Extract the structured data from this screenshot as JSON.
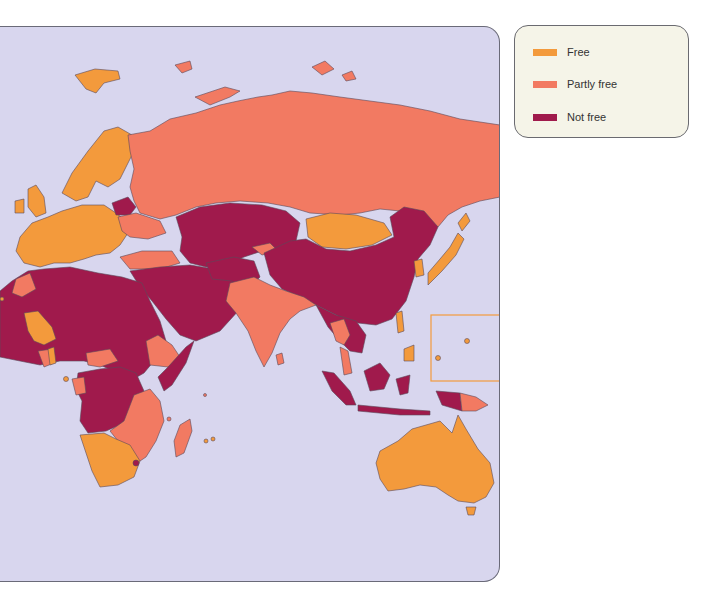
{
  "legend": {
    "items": [
      {
        "label": "Free",
        "color": "#f39a3c"
      },
      {
        "label": "Partly free",
        "color": "#f27a62"
      },
      {
        "label": "Not free",
        "color": "#a01a4c"
      }
    ]
  },
  "map": {
    "ocean_color": "#d8d6ee",
    "border_color": "#5a4a5a",
    "inset_box_color": "#f39a3c",
    "regions": [
      {
        "name": "Western Europe",
        "status": "Free"
      },
      {
        "name": "Scandinavia",
        "status": "Free"
      },
      {
        "name": "Belarus",
        "status": "Not free"
      },
      {
        "name": "Russia",
        "status": "Partly free"
      },
      {
        "name": "Central Asia",
        "status": "Not free"
      },
      {
        "name": "Mongolia",
        "status": "Free"
      },
      {
        "name": "China",
        "status": "Not free"
      },
      {
        "name": "India",
        "status": "Partly free"
      },
      {
        "name": "Middle East",
        "status": "Not free"
      },
      {
        "name": "North Africa",
        "status": "Not free"
      },
      {
        "name": "Mali",
        "status": "Free"
      },
      {
        "name": "Ethiopia",
        "status": "Partly free"
      },
      {
        "name": "Central Africa",
        "status": "Not free"
      },
      {
        "name": "East Africa",
        "status": "Partly free"
      },
      {
        "name": "Southern Africa",
        "status": "Free"
      },
      {
        "name": "Madagascar",
        "status": "Partly free"
      },
      {
        "name": "Japan",
        "status": "Free"
      },
      {
        "name": "South Korea",
        "status": "Free"
      },
      {
        "name": "Southeast Asia",
        "status": "Not free"
      },
      {
        "name": "Thailand",
        "status": "Partly free"
      },
      {
        "name": "Indonesia",
        "status": "Partly free"
      },
      {
        "name": "Philippines",
        "status": "Free"
      },
      {
        "name": "Papua New Guinea",
        "status": "Partly free"
      },
      {
        "name": "Australia",
        "status": "Free"
      }
    ]
  }
}
